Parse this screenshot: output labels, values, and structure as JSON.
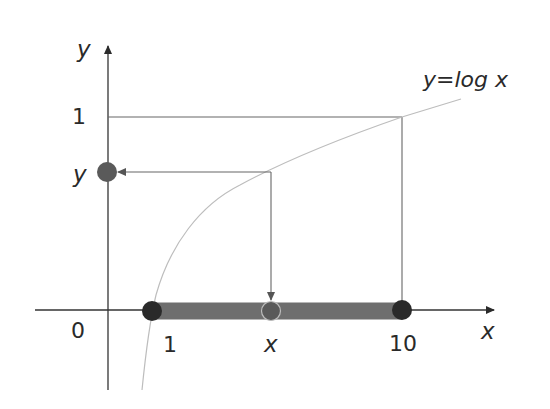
{
  "diagram": {
    "curve_label": "y=log x",
    "axes": {
      "x_label": "x",
      "y_label": "y",
      "origin_label": "0"
    },
    "x_ticks": [
      {
        "label": "1"
      },
      {
        "label": "x"
      },
      {
        "label": "10"
      }
    ],
    "y_ticks": [
      {
        "label": "1"
      },
      {
        "label": "y"
      }
    ],
    "colors": {
      "axis": "#333333",
      "curve": "#bbbbbb",
      "guide": "#666666",
      "interval_bar": "#6e6e6e",
      "endpoint_dot": "#2a2a2a",
      "mid_dot": "#5a5a5a"
    }
  }
}
